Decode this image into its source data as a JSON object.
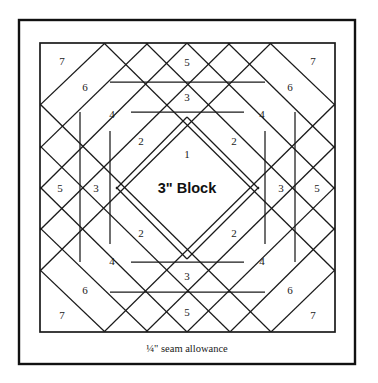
{
  "diagram": {
    "type": "quilt-block-foundation-pattern",
    "pattern_name": "pineapple-log-cabin-block",
    "center_label": "3\" Block",
    "seam_allowance_label": "¼\" seam allowance",
    "colors": {
      "background": "#ffffff",
      "outer_frame": "#111111",
      "inner_frame": "#1a1a1a",
      "seam_line": "#1a1a1a",
      "label_text": "#1a1a1a"
    },
    "geometry": {
      "canvas_width": 378,
      "canvas_height": 383,
      "outer_frame": {
        "x": 19,
        "y": 20,
        "width": 336,
        "height": 344
      },
      "inner_box": {
        "x": 40,
        "y": 43,
        "width": 295,
        "height": 289
      },
      "center": {
        "x": 187,
        "y": 187
      },
      "seam_label_y": 350
    },
    "piece_numbers": [
      {
        "id": "p1",
        "label": "1",
        "x": 187,
        "y": 155,
        "ring": 1,
        "position": "center-diamond"
      },
      {
        "id": "p2-tl",
        "label": "2",
        "x": 141,
        "y": 142,
        "ring": 2,
        "position": "upper-left"
      },
      {
        "id": "p2-tr",
        "label": "2",
        "x": 234,
        "y": 142,
        "ring": 2,
        "position": "upper-right"
      },
      {
        "id": "p2-bl",
        "label": "2",
        "x": 141,
        "y": 234,
        "ring": 2,
        "position": "lower-left"
      },
      {
        "id": "p2-br",
        "label": "2",
        "x": 234,
        "y": 234,
        "ring": 2,
        "position": "lower-right"
      },
      {
        "id": "p3-top",
        "label": "3",
        "x": 187,
        "y": 98,
        "ring": 3,
        "position": "top"
      },
      {
        "id": "p3-left",
        "label": "3",
        "x": 96,
        "y": 189,
        "ring": 3,
        "position": "left"
      },
      {
        "id": "p3-right",
        "label": "3",
        "x": 281,
        "y": 189,
        "ring": 3,
        "position": "right"
      },
      {
        "id": "p3-bottom",
        "label": "3",
        "x": 187,
        "y": 277,
        "ring": 3,
        "position": "bottom"
      },
      {
        "id": "p4-tl",
        "label": "4",
        "x": 112,
        "y": 115,
        "ring": 4,
        "position": "upper-left"
      },
      {
        "id": "p4-tr",
        "label": "4",
        "x": 262,
        "y": 115,
        "ring": 4,
        "position": "upper-right"
      },
      {
        "id": "p4-bl",
        "label": "4",
        "x": 112,
        "y": 262,
        "ring": 4,
        "position": "lower-left"
      },
      {
        "id": "p4-br",
        "label": "4",
        "x": 262,
        "y": 262,
        "ring": 4,
        "position": "lower-right"
      },
      {
        "id": "p5-top",
        "label": "5",
        "x": 187,
        "y": 63,
        "ring": 5,
        "position": "top"
      },
      {
        "id": "p5-left",
        "label": "5",
        "x": 60,
        "y": 189,
        "ring": 5,
        "position": "left"
      },
      {
        "id": "p5-right",
        "label": "5",
        "x": 317,
        "y": 189,
        "ring": 5,
        "position": "right"
      },
      {
        "id": "p5-bottom",
        "label": "5",
        "x": 187,
        "y": 313,
        "ring": 5,
        "position": "bottom"
      },
      {
        "id": "p6-tl",
        "label": "6",
        "x": 85,
        "y": 88,
        "ring": 6,
        "position": "upper-left"
      },
      {
        "id": "p6-tr",
        "label": "6",
        "x": 290,
        "y": 88,
        "ring": 6,
        "position": "upper-right"
      },
      {
        "id": "p6-bl",
        "label": "6",
        "x": 85,
        "y": 291,
        "ring": 6,
        "position": "lower-left"
      },
      {
        "id": "p6-br",
        "label": "6",
        "x": 290,
        "y": 291,
        "ring": 6,
        "position": "lower-right"
      },
      {
        "id": "p7-tl",
        "label": "7",
        "x": 62,
        "y": 62,
        "ring": 7,
        "position": "upper-left"
      },
      {
        "id": "p7-tr",
        "label": "7",
        "x": 313,
        "y": 62,
        "ring": 7,
        "position": "upper-right"
      },
      {
        "id": "p7-bl",
        "label": "7",
        "x": 62,
        "y": 316,
        "ring": 7,
        "position": "lower-left"
      },
      {
        "id": "p7-br",
        "label": "7",
        "x": 313,
        "y": 316,
        "ring": 7,
        "position": "lower-right"
      }
    ],
    "seam_lines": {
      "diagonals_nw_se": [
        "M 40,105 L 105,43",
        "M 40,148 L 148,43",
        "M 40,189 L 187,43",
        "M 116,189 L 187,117",
        "M 40,230 L 230,43",
        "M 40,271 L 271,43"
      ],
      "diagonals_ne_sw": [
        "M 270,43 L 335,105",
        "M 228,43 L 335,148",
        "M 187,43 L 335,189",
        "M 187,117 L 259,189",
        "M 146,43 L 335,230",
        "M 104,43 L 335,271"
      ],
      "diagonals_sw_ne": [
        "M 40,270 L 105,332",
        "M 40,228 L 148,332",
        "M 40,187 L 187,332",
        "M 116,187 L 187,259",
        "M 40,146 L 230,332",
        "M 40,104 L 271,332"
      ],
      "diagonals_se_nw": [
        "M 271,332 L 335,270",
        "M 230,332 L 335,228",
        "M 187,332 L 335,187",
        "M 187,259 L 259,187",
        "M 146,332 L 335,146",
        "M 104,332 L 335,104"
      ],
      "horizontals": [
        "M 110,82 L 265,82",
        "M 131,112 L 244,112",
        "M 131,262 L 244,262",
        "M 110,292 L 265,292"
      ],
      "verticals": [
        "M 80,112 L 80,262",
        "M 110,131 L 110,244",
        "M 265,131 L 265,244",
        "M 295,112 L 295,262"
      ],
      "label_strip_divider": "M 40,332 L 335,332"
    }
  }
}
